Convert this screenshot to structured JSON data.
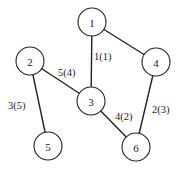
{
  "diagram": {
    "type": "weighted undirected graph",
    "nodes": [
      {
        "id": "1",
        "label": "1",
        "x": 92,
        "y": 22
      },
      {
        "id": "2",
        "label": "2",
        "x": 30,
        "y": 61
      },
      {
        "id": "3",
        "label": "3",
        "x": 91,
        "y": 101
      },
      {
        "id": "4",
        "label": "4",
        "x": 156,
        "y": 62
      },
      {
        "id": "5",
        "label": "5",
        "x": 48,
        "y": 146
      },
      {
        "id": "6",
        "label": "6",
        "x": 136,
        "y": 147
      }
    ],
    "edges": [
      {
        "from": "1",
        "to": "3",
        "label": "1(1)",
        "lx": 94,
        "ly": 60
      },
      {
        "from": "1",
        "to": "4",
        "label": "",
        "lx": 0,
        "ly": 0
      },
      {
        "from": "2",
        "to": "3",
        "label": "5(4)",
        "lx": 58,
        "ly": 76
      },
      {
        "from": "2",
        "to": "5",
        "label": "3(5)",
        "lx": 8,
        "ly": 109
      },
      {
        "from": "3",
        "to": "6",
        "label": "4(2)",
        "lx": 115,
        "ly": 120
      },
      {
        "from": "4",
        "to": "6",
        "label": "2(3)",
        "lx": 152,
        "ly": 113
      }
    ]
  }
}
